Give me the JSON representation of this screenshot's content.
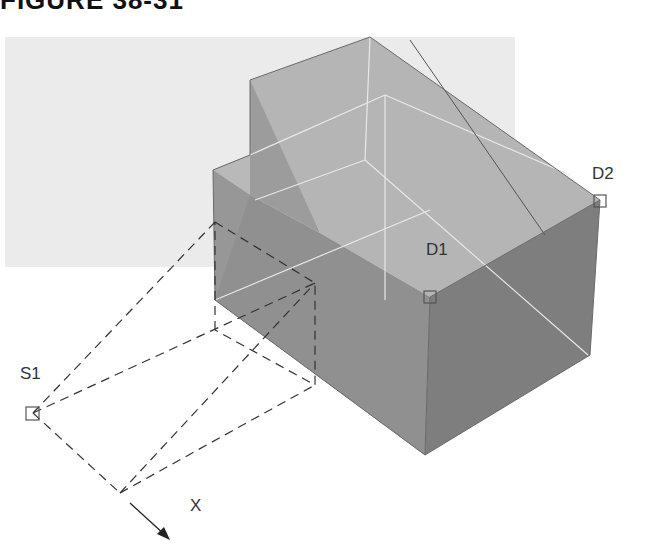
{
  "figure": {
    "title": "FIGURE 38-31"
  },
  "labels": {
    "d1": "D1",
    "d2": "D2",
    "s1": "S1",
    "x": "X"
  },
  "colors": {
    "top_face": "#b8b8b8",
    "wedge_top": "#b3b3b3",
    "left_face": "#9a9a9a",
    "front_face": "#8f8f8f",
    "right_face": "#7d7d7d",
    "background_band": "#ebebeb",
    "dash": "#444444",
    "hidden_edge": "#e6e6e6"
  }
}
